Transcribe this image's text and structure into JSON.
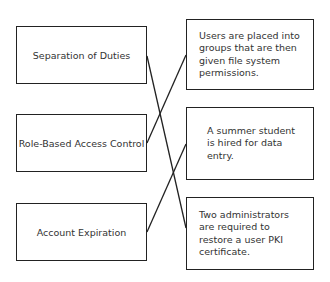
{
  "diagram": {
    "type": "matching",
    "left_items": [
      {
        "id": "L1",
        "label": "Separation of Duties"
      },
      {
        "id": "L2",
        "label": "Role-Based Access Control"
      },
      {
        "id": "L3",
        "label": "Account Expiration"
      }
    ],
    "right_items": [
      {
        "id": "R1",
        "label": "Users are placed into groups that are then given file system permissions."
      },
      {
        "id": "R2",
        "label": "A summer student is hired for data entry."
      },
      {
        "id": "R3",
        "label": "Two administrators are required to restore a user PKI certificate."
      }
    ],
    "connections": [
      {
        "from": "L1",
        "to": "R3"
      },
      {
        "from": "L2",
        "to": "R1"
      },
      {
        "from": "L3",
        "to": "R2"
      }
    ]
  }
}
